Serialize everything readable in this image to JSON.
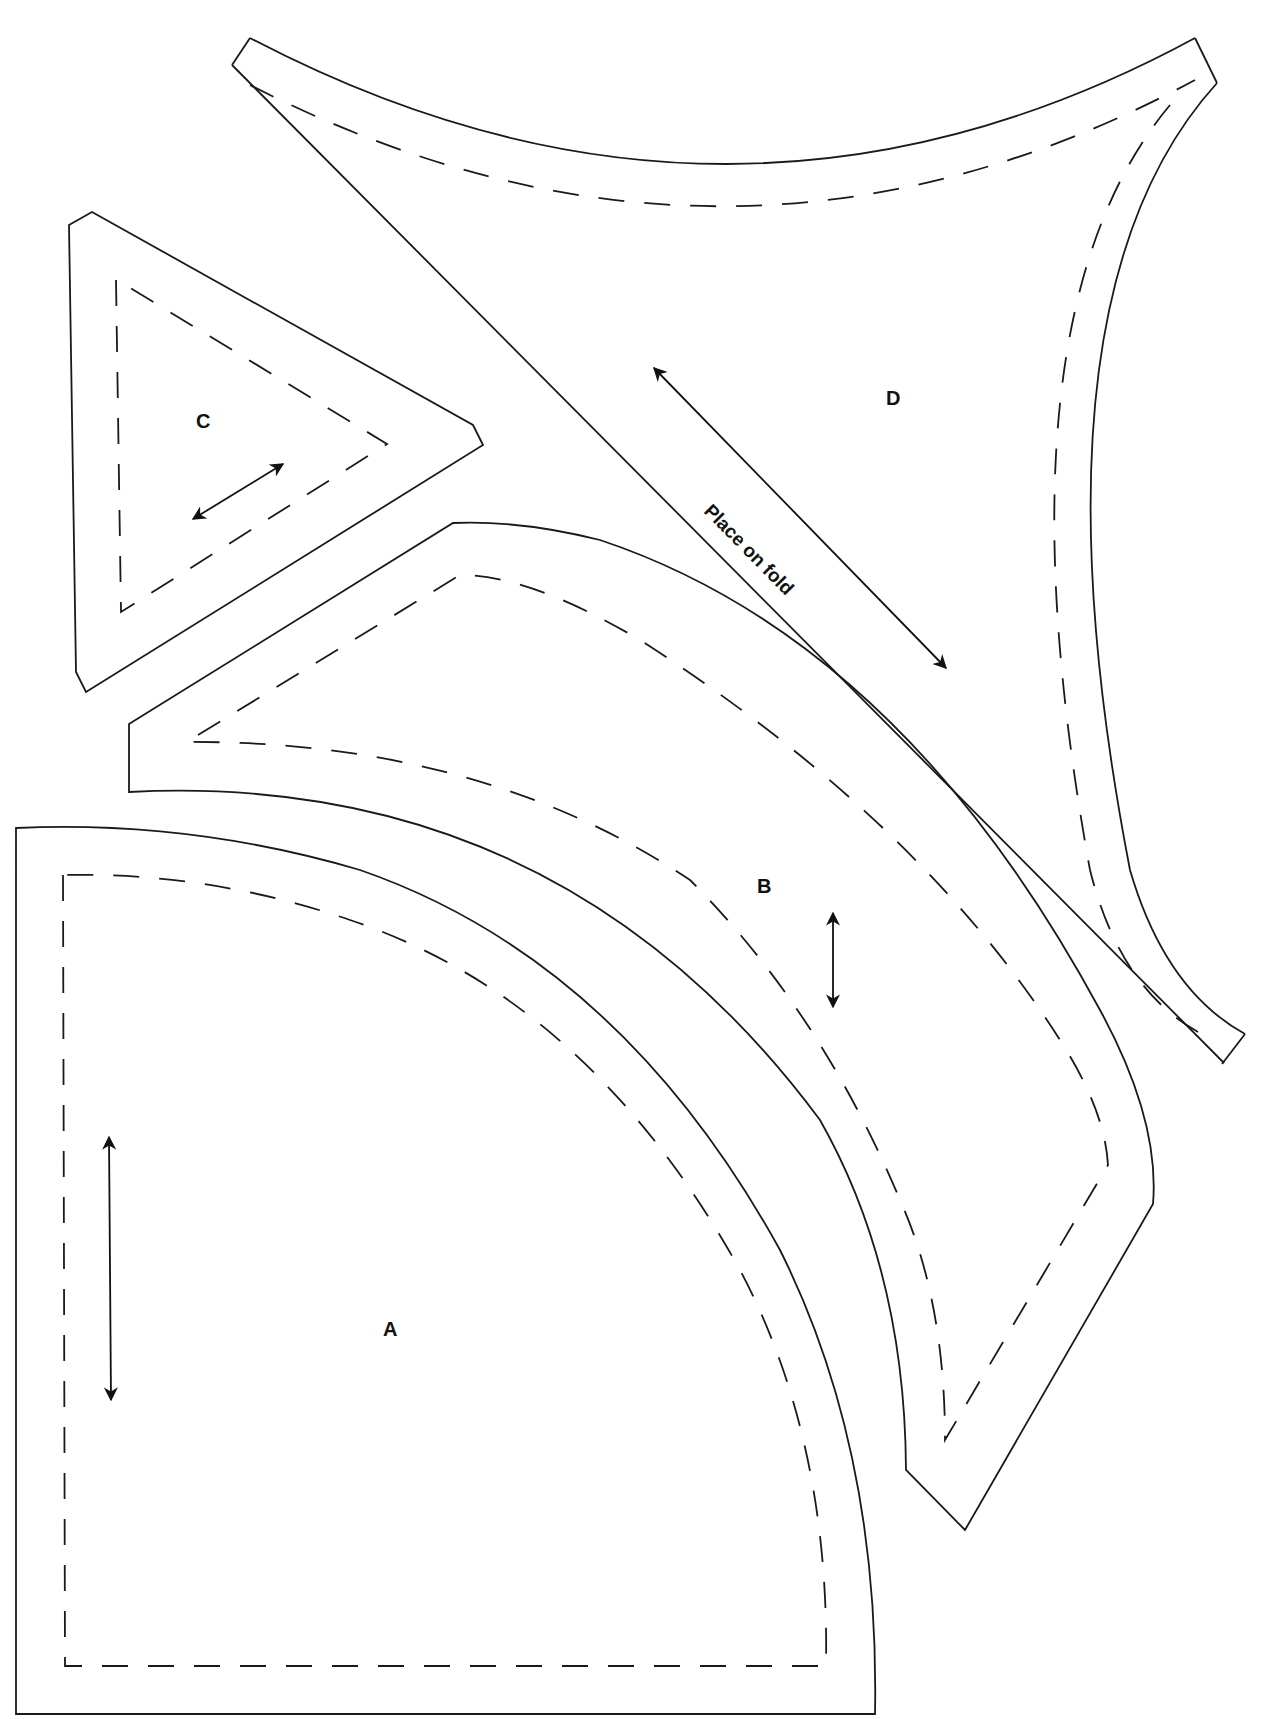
{
  "document": {
    "type": "quilt pattern template sheet",
    "colors": {
      "line": "#1a1a1a",
      "background": "#ffffff"
    }
  },
  "pieces": [
    {
      "id": "A",
      "label": "A",
      "description": "quarter-circle piece with seam allowance",
      "grainline": "vertical"
    },
    {
      "id": "B",
      "label": "B",
      "description": "curved arc piece with seam allowance",
      "grainline": "vertical"
    },
    {
      "id": "C",
      "label": "C",
      "description": "triangle piece with seam allowance",
      "grainline": "diagonal"
    },
    {
      "id": "D",
      "label": "D",
      "description": "concave triangular piece placed on fold",
      "grainline": "diagonal",
      "annotation": "Place on fold"
    }
  ],
  "legend": {
    "solid_line": "cutting line",
    "dashed_line": "sewing line",
    "double_arrow": "grainline"
  }
}
